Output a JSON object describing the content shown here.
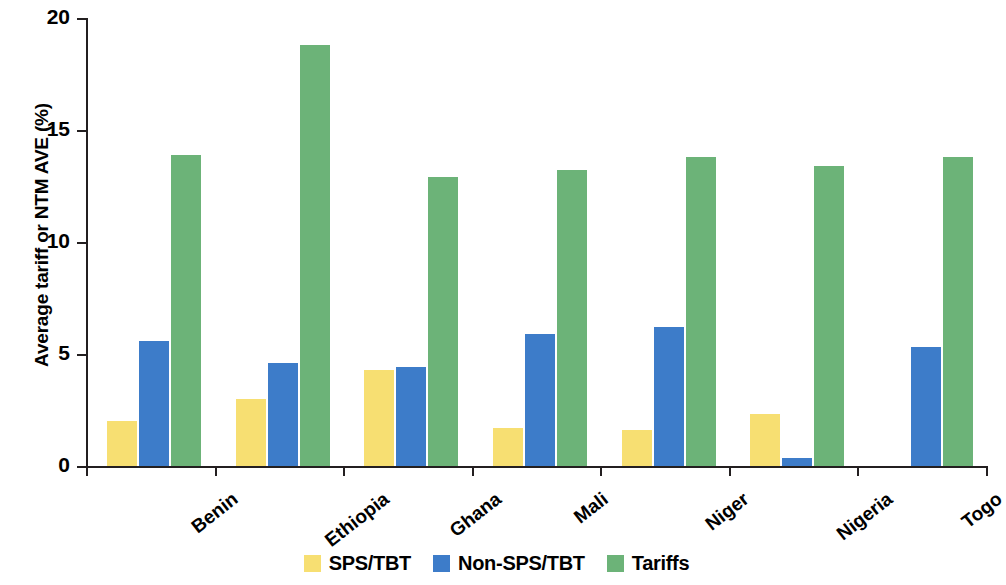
{
  "chart_data": {
    "type": "bar",
    "title": "",
    "xlabel": "",
    "ylabel": "Average tariff or NTM AVE (%)",
    "ylim": [
      0,
      20
    ],
    "yticks": [
      0,
      5,
      10,
      15,
      20
    ],
    "ytick_labels": [
      "0",
      "5",
      "10",
      "15",
      "20"
    ],
    "grid": false,
    "legend_position": "bottom",
    "categories": [
      "Benin",
      "Ethiopia",
      "Ghana",
      "Mali",
      "Niger",
      "Nigeria",
      "Togo"
    ],
    "series": [
      {
        "name": "SPS/TBT",
        "color": "#F7DF72",
        "values": [
          2.0,
          3.0,
          4.3,
          1.7,
          1.6,
          2.3,
          0
        ]
      },
      {
        "name": "Non-SPS/TBT",
        "color": "#3D7CC9",
        "values": [
          5.6,
          4.6,
          4.4,
          5.9,
          6.2,
          0.35,
          5.3
        ]
      },
      {
        "name": "Tariffs",
        "color": "#6CB378",
        "values": [
          13.9,
          18.8,
          12.9,
          13.2,
          13.8,
          13.4,
          13.8
        ]
      }
    ]
  }
}
